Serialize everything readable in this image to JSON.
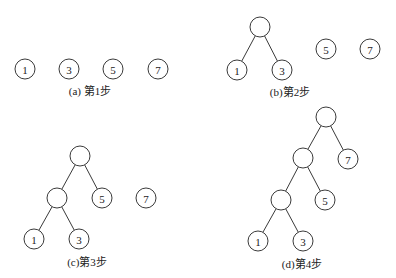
{
  "style": {
    "stroke": "#3a3a3a",
    "fill": "#ffffff",
    "text": "#222222",
    "node_radius": 10
  },
  "panels": [
    {
      "id": "a",
      "caption": "(a) 第1步",
      "caption_pos": {
        "x": 90,
        "y": 86
      },
      "nodes": [
        {
          "id": "a1",
          "x": 25,
          "y": 69,
          "label": "1"
        },
        {
          "id": "a3",
          "x": 69,
          "y": 69,
          "label": "3"
        },
        {
          "id": "a5",
          "x": 113,
          "y": 69,
          "label": "5"
        },
        {
          "id": "a7",
          "x": 158,
          "y": 69,
          "label": "7"
        }
      ],
      "edges": []
    },
    {
      "id": "b",
      "caption": "(b)第2步",
      "caption_pos": {
        "x": 290,
        "y": 87
      },
      "nodes": [
        {
          "id": "b_root",
          "x": 260,
          "y": 27,
          "label": ""
        },
        {
          "id": "b1",
          "x": 237,
          "y": 70,
          "label": "1"
        },
        {
          "id": "b3",
          "x": 282,
          "y": 70,
          "label": "3"
        },
        {
          "id": "b5",
          "x": 326,
          "y": 49,
          "label": "5"
        },
        {
          "id": "b7",
          "x": 370,
          "y": 49,
          "label": "7"
        }
      ],
      "edges": [
        [
          "b_root",
          "b1"
        ],
        [
          "b_root",
          "b3"
        ]
      ]
    },
    {
      "id": "c",
      "caption": "(c)第3步",
      "caption_pos": {
        "x": 87,
        "y": 257
      },
      "nodes": [
        {
          "id": "c_root",
          "x": 80,
          "y": 156,
          "label": ""
        },
        {
          "id": "c_mid",
          "x": 57,
          "y": 198,
          "label": ""
        },
        {
          "id": "c5",
          "x": 102,
          "y": 198,
          "label": "5"
        },
        {
          "id": "c7",
          "x": 146,
          "y": 198,
          "label": "7"
        },
        {
          "id": "c1",
          "x": 34,
          "y": 239,
          "label": "1"
        },
        {
          "id": "c3",
          "x": 79,
          "y": 239,
          "label": "3"
        }
      ],
      "edges": [
        [
          "c_root",
          "c_mid"
        ],
        [
          "c_root",
          "c5"
        ],
        [
          "c_mid",
          "c1"
        ],
        [
          "c_mid",
          "c3"
        ]
      ]
    },
    {
      "id": "d",
      "caption": "(d)第4步",
      "caption_pos": {
        "x": 302,
        "y": 259
      },
      "nodes": [
        {
          "id": "d_root",
          "x": 326,
          "y": 117,
          "label": ""
        },
        {
          "id": "d_mid1",
          "x": 303,
          "y": 158,
          "label": ""
        },
        {
          "id": "d7",
          "x": 348,
          "y": 159,
          "label": "7"
        },
        {
          "id": "d_mid2",
          "x": 281,
          "y": 200,
          "label": ""
        },
        {
          "id": "d5",
          "x": 325,
          "y": 200,
          "label": "5"
        },
        {
          "id": "d1",
          "x": 258,
          "y": 241,
          "label": "1"
        },
        {
          "id": "d3",
          "x": 303,
          "y": 241,
          "label": "3"
        }
      ],
      "edges": [
        [
          "d_root",
          "d_mid1"
        ],
        [
          "d_root",
          "d7"
        ],
        [
          "d_mid1",
          "d_mid2"
        ],
        [
          "d_mid1",
          "d5"
        ],
        [
          "d_mid2",
          "d1"
        ],
        [
          "d_mid2",
          "d3"
        ]
      ]
    }
  ]
}
